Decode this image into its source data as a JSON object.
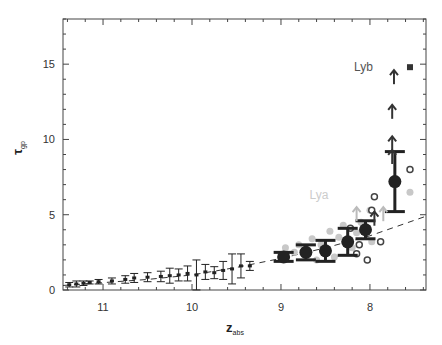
{
  "chart_data": {
    "type": "scatter",
    "title": "",
    "xlabel": "z_abs",
    "ylabel": "τ_gp",
    "xlim": [
      11.45,
      7.37
    ],
    "ylim": [
      0,
      18
    ],
    "x_reversed": true,
    "grid": false,
    "x_ticks": [
      11,
      10,
      9,
      8
    ],
    "y_ticks": [
      0,
      5,
      10,
      15
    ],
    "annotations": [
      {
        "text": "Lyb",
        "z": 7.9,
        "tau": 14.8,
        "color": "#555555"
      },
      {
        "text": "Lya",
        "z": 8.4,
        "tau": 6.3,
        "color": "#cccccc"
      }
    ],
    "series": [
      {
        "name": "low-z binned (error bars)",
        "marker": "errorbar",
        "color": "#222222",
        "points": [
          {
            "z": 11.38,
            "tau": 0.35,
            "err": 0.15
          },
          {
            "z": 11.3,
            "tau": 0.4,
            "err": 0.2
          },
          {
            "z": 11.22,
            "tau": 0.45,
            "err": 0.15
          },
          {
            "z": 11.15,
            "tau": 0.5,
            "err": 0.1
          },
          {
            "z": 11.05,
            "tau": 0.55,
            "err": 0.15
          },
          {
            "z": 10.9,
            "tau": 0.6,
            "err": 0.2
          },
          {
            "z": 10.75,
            "tau": 0.7,
            "err": 0.25
          },
          {
            "z": 10.65,
            "tau": 0.8,
            "err": 0.3
          },
          {
            "z": 10.5,
            "tau": 0.85,
            "err": 0.3
          },
          {
            "z": 10.35,
            "tau": 0.9,
            "err": 0.35
          },
          {
            "z": 10.25,
            "tau": 0.95,
            "err": 0.5
          },
          {
            "z": 10.15,
            "tau": 1.0,
            "err": 0.4
          },
          {
            "z": 10.05,
            "tau": 1.1,
            "err": 0.5
          },
          {
            "z": 9.95,
            "tau": 1.0,
            "err": 1.0
          },
          {
            "z": 9.85,
            "tau": 1.2,
            "err": 0.5
          },
          {
            "z": 9.75,
            "tau": 1.15,
            "err": 0.4
          },
          {
            "z": 9.65,
            "tau": 1.3,
            "err": 0.6
          },
          {
            "z": 9.55,
            "tau": 1.4,
            "err": 1.0
          },
          {
            "z": 9.45,
            "tau": 1.6,
            "err": 0.8
          },
          {
            "z": 9.35,
            "tau": 1.6,
            "err": 0.3
          }
        ]
      },
      {
        "name": "high-z binned (filled circles)",
        "marker": "filled-circle",
        "color": "#222222",
        "points": [
          {
            "z": 8.97,
            "tau": 2.2,
            "err": 0.3
          },
          {
            "z": 8.72,
            "tau": 2.5,
            "err": 0.5
          },
          {
            "z": 8.5,
            "tau": 2.6,
            "err": 0.7
          },
          {
            "z": 8.25,
            "tau": 3.2,
            "err": 0.9
          },
          {
            "z": 8.05,
            "tau": 4.0,
            "err": 0.6
          },
          {
            "z": 7.72,
            "tau": 7.2,
            "err": 2.0
          }
        ]
      },
      {
        "name": "individual (grey filled)",
        "marker": "grey-circle",
        "color": "#c8c8c8",
        "points": [
          {
            "z": 8.95,
            "tau": 2.8
          },
          {
            "z": 8.85,
            "tau": 2.5
          },
          {
            "z": 8.8,
            "tau": 3.0
          },
          {
            "z": 8.65,
            "tau": 3.4
          },
          {
            "z": 8.6,
            "tau": 2.0
          },
          {
            "z": 8.55,
            "tau": 3.0
          },
          {
            "z": 8.45,
            "tau": 3.9
          },
          {
            "z": 8.4,
            "tau": 2.2
          },
          {
            "z": 8.35,
            "tau": 3.5
          },
          {
            "z": 8.3,
            "tau": 4.3
          },
          {
            "z": 8.2,
            "tau": 2.8
          },
          {
            "z": 8.15,
            "tau": 3.8
          },
          {
            "z": 8.1,
            "tau": 4.5
          },
          {
            "z": 8.0,
            "tau": 5.3
          },
          {
            "z": 7.98,
            "tau": 3.2
          },
          {
            "z": 7.55,
            "tau": 6.5
          }
        ]
      },
      {
        "name": "individual (open circles)",
        "marker": "open-circle",
        "color": "#444444",
        "points": [
          {
            "z": 8.22,
            "tau": 4.1
          },
          {
            "z": 8.15,
            "tau": 2.4
          },
          {
            "z": 8.12,
            "tau": 3.0
          },
          {
            "z": 8.03,
            "tau": 2.0
          },
          {
            "z": 7.98,
            "tau": 5.3
          },
          {
            "z": 7.95,
            "tau": 6.2
          },
          {
            "z": 7.88,
            "tau": 3.2
          },
          {
            "z": 7.55,
            "tau": 8.0
          }
        ]
      },
      {
        "name": "lower limits (arrows)",
        "marker": "up-arrow",
        "color": "#333333",
        "points": [
          {
            "z": 7.73,
            "tau": 14.6
          },
          {
            "z": 7.75,
            "tau": 12.3
          },
          {
            "z": 7.75,
            "tau": 10.2
          },
          {
            "z": 7.75,
            "tau": 9.3
          },
          {
            "z": 7.95,
            "tau": 5.2
          }
        ]
      },
      {
        "name": "Lya lower limits (grey arrows)",
        "marker": "up-arrow",
        "color": "#bbbbbb",
        "points": [
          {
            "z": 8.15,
            "tau": 5.5
          },
          {
            "z": 7.85,
            "tau": 5.5
          }
        ]
      },
      {
        "name": "Lyb square",
        "marker": "square",
        "color": "#333333",
        "points": [
          {
            "z": 7.55,
            "tau": 14.8
          }
        ]
      },
      {
        "name": "model (dashed)",
        "marker": "dashed-line",
        "color": "#333333",
        "points": [
          {
            "z": 11.45,
            "tau": 0.3
          },
          {
            "z": 10.5,
            "tau": 0.7
          },
          {
            "z": 10.0,
            "tau": 1.0
          },
          {
            "z": 9.5,
            "tau": 1.5
          },
          {
            "z": 9.0,
            "tau": 2.1
          },
          {
            "z": 8.5,
            "tau": 2.8
          },
          {
            "z": 8.0,
            "tau": 3.6
          },
          {
            "z": 7.37,
            "tau": 4.9
          }
        ]
      }
    ]
  },
  "axes": {
    "x_label_main": "z",
    "x_label_sub": "abs",
    "y_label_main": "τ",
    "y_label_sub": "gp"
  }
}
